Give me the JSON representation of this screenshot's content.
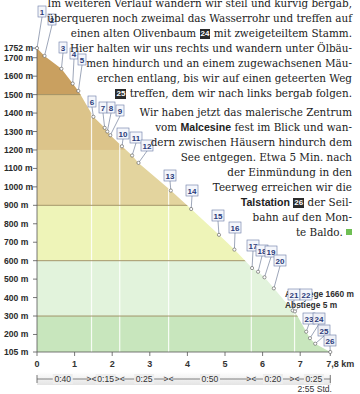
{
  "text": {
    "lines": [
      {
        "top": -4,
        "segments": [
          {
            "t": "Im weiteren Verlauf wandern wir steil und kurvig bergab,"
          }
        ]
      },
      {
        "top": 11,
        "segments": [
          {
            "t": "überqueren noch zweimal das Wasserrohr und treffen auf"
          }
        ]
      },
      {
        "top": 26,
        "segments": [
          {
            "t": "einen alten Olivenbaum "
          },
          {
            "wp": "24"
          },
          {
            "t": " mit zweigeteiltem Stamm."
          }
        ]
      },
      {
        "top": 41,
        "segments": [
          {
            "t": "Hier halten wir uns rechts und wandern unter Ölbäu-"
          }
        ]
      },
      {
        "top": 56,
        "segments": [
          {
            "t": "men hindurch und an einem zugewachsenen Mäu-"
          }
        ]
      },
      {
        "top": 71,
        "segments": [
          {
            "t": "erchen entlang, bis wir auf einen geteerten Weg"
          }
        ]
      },
      {
        "top": 86,
        "segments": [
          {
            "wp": "25"
          },
          {
            "t": " treffen, dem wir nach links bergab folgen."
          }
        ]
      },
      {
        "top": 105,
        "segments": [
          {
            "t": "Wir haben jetzt das malerische Zentrum"
          }
        ]
      },
      {
        "top": 120,
        "segments": [
          {
            "t": "vom "
          },
          {
            "b": "Malcesine"
          },
          {
            "t": " fest im Blick und wan-"
          }
        ]
      },
      {
        "top": 135,
        "segments": [
          {
            "t": "dern zwischen Häusern hindurch dem"
          }
        ]
      },
      {
        "top": 150,
        "segments": [
          {
            "t": "See entgegen. Etwa 5 Min. nach"
          }
        ]
      },
      {
        "top": 165,
        "segments": [
          {
            "t": "der  Einmündung  in  den"
          }
        ]
      },
      {
        "top": 180,
        "segments": [
          {
            "t": "Teerweg erreichen wir die"
          }
        ]
      },
      {
        "top": 195,
        "segments": [
          {
            "b": "Talstation"
          },
          {
            "t": " "
          },
          {
            "wp": "26"
          },
          {
            "t": " der Seil-"
          }
        ]
      },
      {
        "top": 210,
        "segments": [
          {
            "t": "bahn auf den Mon-"
          }
        ]
      },
      {
        "top": 225,
        "segments": [
          {
            "t": "te Baldo. "
          },
          {
            "sq": true
          }
        ]
      }
    ]
  },
  "chart_data": {
    "type": "area",
    "xlabel": "km",
    "ylabel": "m",
    "xlim": [
      0,
      7.8
    ],
    "ylim": [
      105,
      1752
    ],
    "y_ticks": [
      "1752 m",
      "1700 m",
      "1600 m",
      "1500 m",
      "1400 m",
      "1300 m",
      "1200 m",
      "1100 m",
      "1000 m",
      "900 m",
      "800 m",
      "700 m",
      "600 m",
      "500 m",
      "400 m",
      "300 m",
      "200 m",
      "105 m"
    ],
    "x_ticks": [
      "0",
      "1",
      "2",
      "3",
      "4",
      "5",
      "6",
      "7",
      "7,8 km"
    ],
    "bands": [
      {
        "from": 1500,
        "to": 1752,
        "color": "#c9a060"
      },
      {
        "from": 1200,
        "to": 1500,
        "color": "#dcc48a"
      },
      {
        "from": 900,
        "to": 1200,
        "color": "#e3d49e"
      },
      {
        "from": 600,
        "to": 900,
        "color": "#eef4b8"
      },
      {
        "from": 300,
        "to": 600,
        "color": "#e2f3dc"
      },
      {
        "from": 105,
        "to": 300,
        "color": "#c8e6bd"
      }
    ],
    "waypoints": [
      {
        "n": "1",
        "km": 0.0,
        "alt": 1752
      },
      {
        "n": "2",
        "km": 0.2,
        "alt": 1710
      },
      {
        "n": "3",
        "km": 0.65,
        "alt": 1640
      },
      {
        "n": "4",
        "km": 0.95,
        "alt": 1560
      },
      {
        "n": "5",
        "km": 1.1,
        "alt": 1520
      },
      {
        "n": "6",
        "km": 1.5,
        "alt": 1380
      },
      {
        "n": "7",
        "km": 1.8,
        "alt": 1320
      },
      {
        "n": "8",
        "km": 1.87,
        "alt": 1300
      },
      {
        "n": "9",
        "km": 1.95,
        "alt": 1280
      },
      {
        "n": "10",
        "km": 2.26,
        "alt": 1220
      },
      {
        "n": "11",
        "km": 2.53,
        "alt": 1170
      },
      {
        "n": "12",
        "km": 2.7,
        "alt": 1130
      },
      {
        "n": "13",
        "km": 3.56,
        "alt": 980
      },
      {
        "n": "14",
        "km": 4.1,
        "alt": 880
      },
      {
        "n": "15",
        "km": 4.84,
        "alt": 740
      },
      {
        "n": "16",
        "km": 5.25,
        "alt": 660
      },
      {
        "n": "17",
        "km": 5.72,
        "alt": 560
      },
      {
        "n": "18",
        "km": 5.88,
        "alt": 540
      },
      {
        "n": "19",
        "km": 6.05,
        "alt": 510
      },
      {
        "n": "20",
        "km": 6.3,
        "alt": 450
      },
      {
        "n": "21",
        "km": 6.8,
        "alt": 330
      },
      {
        "n": "22",
        "km": 6.86,
        "alt": 325
      },
      {
        "n": "23",
        "km": 7.16,
        "alt": 215
      },
      {
        "n": "24",
        "km": 7.26,
        "alt": 180
      },
      {
        "n": "25",
        "km": 7.4,
        "alt": 150
      },
      {
        "n": "26",
        "km": 7.8,
        "alt": 105
      }
    ],
    "segments_time": [
      "0:40",
      "0:15",
      "0:25",
      "0:50",
      "0:20",
      "0:25"
    ],
    "segment_breaks_km": [
      1.45,
      2.2,
      3.5,
      5.7,
      6.85
    ],
    "total_time": "2:55 Std.",
    "ascent": "Aufstiege 1660 m",
    "descent": "Abstiege 5 m"
  }
}
